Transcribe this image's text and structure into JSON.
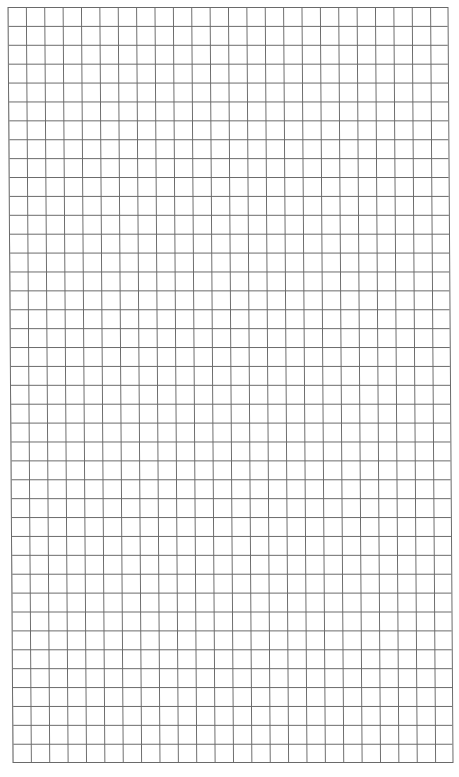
{
  "page": {
    "type": "graph-paper",
    "background_color": "#ffffff",
    "line_color": "#6a6a6a"
  },
  "grid": {
    "columns": 24,
    "rows": 40
  }
}
